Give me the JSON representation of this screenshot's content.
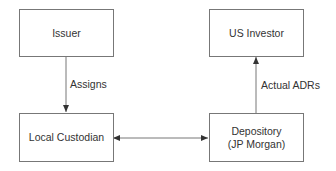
{
  "nodes": {
    "issuer": "Issuer",
    "local_custodian": "Local Custodian",
    "us_investor": "US Investor",
    "depository_line1": "Depository",
    "depository_line2": "(JP Morgan)"
  },
  "edges": {
    "assigns": "Assigns",
    "actual_adrs": "Actual ADRs"
  },
  "colors": {
    "line": "#777777",
    "arrow": "#333333"
  }
}
